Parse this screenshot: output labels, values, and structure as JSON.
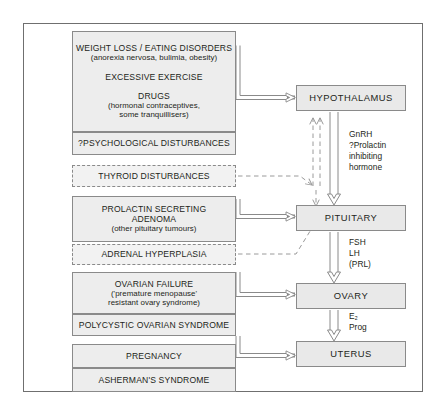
{
  "diagram": {
    "frame_border_color": "#6f6f6f",
    "box_fill": "#ededed",
    "box_border": "#8a8a8a",
    "arrow_color": "#8a8a8a"
  },
  "causes": [
    {
      "id": "weight-loss",
      "style": "solid",
      "lines": [
        {
          "text": "WEIGHT LOSS / EATING DISORDERS",
          "emphasis": "caps"
        },
        {
          "text": "(anorexia nervosa, bulimia, obesity)",
          "emphasis": "sub"
        },
        {
          "text": "",
          "emphasis": "spacer"
        },
        {
          "text": "EXCESSIVE EXERCISE",
          "emphasis": "caps"
        },
        {
          "text": "",
          "emphasis": "spacer"
        },
        {
          "text": "DRUGS",
          "emphasis": "caps"
        },
        {
          "text": "(hormonal contraceptives,",
          "emphasis": "sub"
        },
        {
          "text": "some tranquillisers)",
          "emphasis": "sub"
        }
      ]
    },
    {
      "id": "psychological",
      "style": "solid",
      "lines": [
        {
          "text": "?PSYCHOLOGICAL DISTURBANCES",
          "emphasis": "caps"
        }
      ]
    },
    {
      "id": "thyroid",
      "style": "dashed",
      "lines": [
        {
          "text": "THYROID DISTURBANCES",
          "emphasis": "caps"
        }
      ]
    },
    {
      "id": "prolactinoma",
      "style": "solid",
      "lines": [
        {
          "text": "PROLACTIN SECRETING",
          "emphasis": "caps"
        },
        {
          "text": "ADENOMA",
          "emphasis": "caps"
        },
        {
          "text": "(other pituitary tumours)",
          "emphasis": "sub"
        }
      ]
    },
    {
      "id": "adrenal",
      "style": "dashed",
      "lines": [
        {
          "text": "ADRENAL HYPERPLASIA",
          "emphasis": "caps"
        }
      ]
    },
    {
      "id": "ovarian-failure",
      "style": "solid",
      "lines": [
        {
          "text": "OVARIAN FAILURE",
          "emphasis": "caps"
        },
        {
          "text": "('premature menopause'",
          "emphasis": "sub"
        },
        {
          "text": "resistant ovary syndrome)",
          "emphasis": "sub"
        }
      ]
    },
    {
      "id": "pcos",
      "style": "solid",
      "lines": [
        {
          "text": "POLYCYSTIC OVARIAN SYNDROME",
          "emphasis": "caps"
        }
      ]
    },
    {
      "id": "pregnancy",
      "style": "solid",
      "lines": [
        {
          "text": "PREGNANCY",
          "emphasis": "caps"
        }
      ]
    },
    {
      "id": "ashermans",
      "style": "solid",
      "lines": [
        {
          "text": "ASHERMAN'S SYNDROME",
          "emphasis": "caps"
        }
      ]
    }
  ],
  "axis": [
    {
      "id": "hypothalamus",
      "label": "HYPOTHALAMUS"
    },
    {
      "id": "pituitary",
      "label": "PITUITARY"
    },
    {
      "id": "ovary",
      "label": "OVARY"
    },
    {
      "id": "uterus",
      "label": "UTERUS"
    }
  ],
  "hormones": [
    {
      "id": "hypothalamus-to-pituitary",
      "lines": [
        "GnRH",
        "?Prolactin",
        "inhibiting",
        "hormone"
      ]
    },
    {
      "id": "pituitary-to-ovary",
      "lines": [
        "FSH",
        "LH",
        "(PRL)"
      ]
    },
    {
      "id": "ovary-to-uterus",
      "lines": [
        "E₂",
        "Prog"
      ]
    }
  ]
}
